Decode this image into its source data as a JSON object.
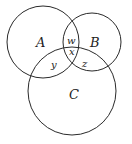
{
  "diagram": {
    "type": "venn",
    "circles": [
      {
        "name": "A",
        "cx": 43,
        "cy": 42,
        "r": 36
      },
      {
        "name": "B",
        "cx": 92,
        "cy": 42,
        "r": 29
      },
      {
        "name": "C",
        "cx": 72,
        "cy": 91,
        "r": 44
      }
    ],
    "labels": {
      "A": "A",
      "B": "B",
      "C": "C",
      "w": "w",
      "x": "x",
      "y": "y",
      "z": "z"
    },
    "stroke_color": "#2a2a2a"
  }
}
